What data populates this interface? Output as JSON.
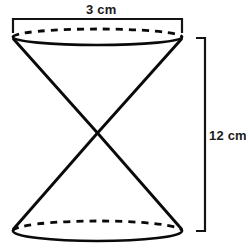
{
  "figure": {
    "background_color": "#ffffff",
    "line_color": "#0a0a0a"
  },
  "labels": {
    "diameter": "3 cm",
    "height": "12 cm"
  },
  "dimensions": {
    "diameter_value": 3,
    "diameter_unit": "cm",
    "height_value": 12,
    "height_unit": "cm"
  },
  "geometry": {
    "top_ellipse": {
      "cx": 97.5,
      "cy": 37,
      "rx": 84.5,
      "ry": 8
    },
    "bottom_ellipse": {
      "cx": 97.5,
      "cy": 231,
      "rx": 84.5,
      "ry": 10
    },
    "apex": {
      "x": 97.5,
      "y": 133
    },
    "top_bracket": {
      "x1": 13,
      "x2": 182,
      "y": 19,
      "tick_length": 14
    },
    "right_bracket": {
      "x": 205,
      "y1": 38,
      "y2": 231,
      "tick_length": 9
    }
  }
}
